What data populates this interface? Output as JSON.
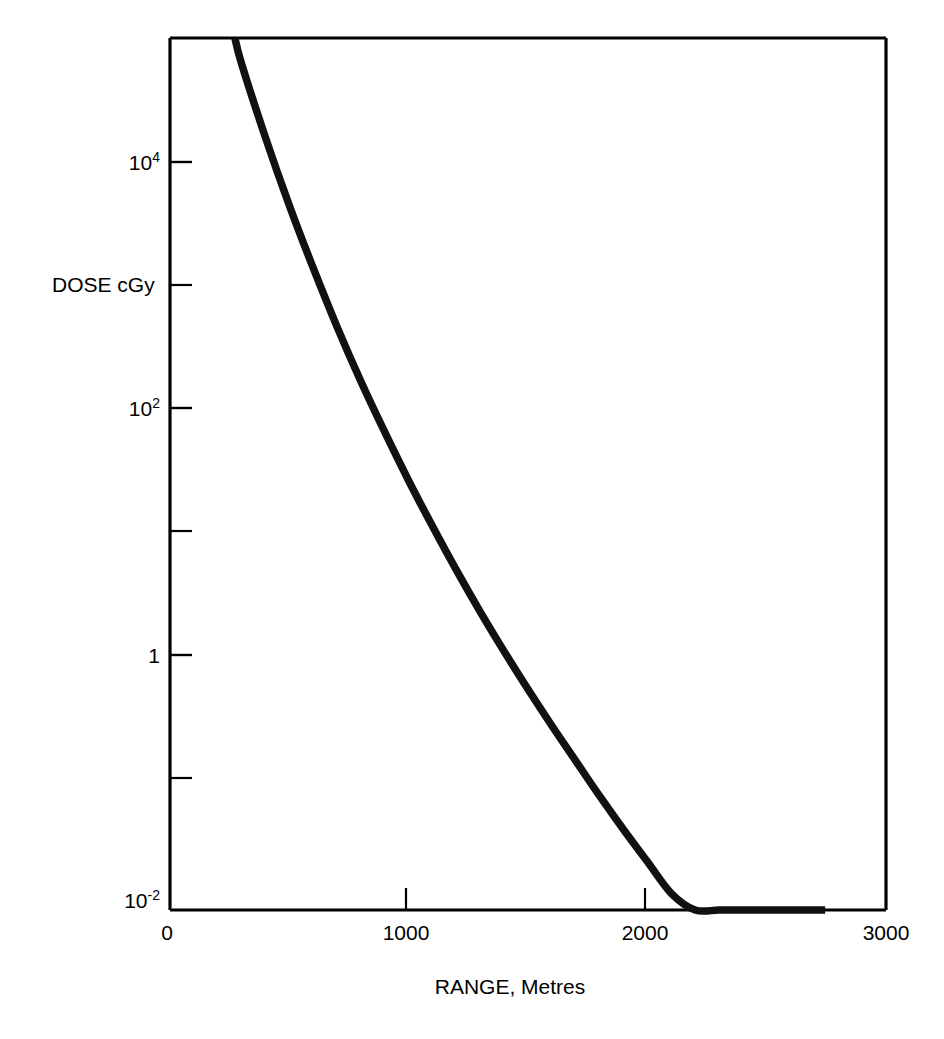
{
  "chart_data": {
    "type": "line",
    "title": "",
    "xlabel": "RANGE, Metres",
    "ylabel": "DOSE cGy",
    "xlim": [
      0,
      3000
    ],
    "ylim": [
      0.01,
      300000
    ],
    "yscale": "log",
    "xscale": "linear",
    "grid": false,
    "legend": null,
    "xticks": [
      {
        "value": 0,
        "label": "0"
      },
      {
        "value": 1000,
        "label": "1000"
      },
      {
        "value": 2000,
        "label": "2000"
      },
      {
        "value": 3000,
        "label": "3000"
      }
    ],
    "yticks": [
      {
        "value": 10000,
        "mantissa": "10",
        "exponent": "4",
        "label": "10^4",
        "labeled": true
      },
      {
        "value": 1000,
        "mantissa": "",
        "exponent": "",
        "label": "",
        "labeled": false
      },
      {
        "value": 100,
        "mantissa": "10",
        "exponent": "2",
        "label": "10^2",
        "labeled": true
      },
      {
        "value": 10,
        "mantissa": "",
        "exponent": "",
        "label": "",
        "labeled": false
      },
      {
        "value": 1,
        "mantissa": "1",
        "exponent": "",
        "label": "1",
        "labeled": true
      },
      {
        "value": 0.1,
        "mantissa": "",
        "exponent": "",
        "label": "",
        "labeled": false
      },
      {
        "value": 0.01,
        "mantissa": "10",
        "exponent": "-2",
        "label": "10^-2",
        "labeled": true
      }
    ],
    "series": [
      {
        "name": "Dose vs Range",
        "x": [
          272,
          300,
          400,
          500,
          600,
          700,
          800,
          900,
          1000,
          1100,
          1200,
          1300,
          1400,
          1500,
          1600,
          1700,
          1800,
          1900,
          2000,
          2100,
          2200,
          2300,
          2400,
          2500,
          2600,
          2700,
          2745
        ],
        "y": [
          300000,
          180000,
          42000,
          11000,
          3200,
          1000,
          340,
          125,
          48,
          19.5,
          8.2,
          3.6,
          1.65,
          0.78,
          0.38,
          0.19,
          0.095,
          0.049,
          0.026,
          0.0139,
          0.00755,
          0.00415,
          0.0023,
          0.00129,
          0.00073,
          0.00042,
          0.0003
        ]
      }
    ],
    "annotations": []
  },
  "axis_titles": {
    "x": "RANGE, Metres",
    "y": "DOSE cGy"
  }
}
